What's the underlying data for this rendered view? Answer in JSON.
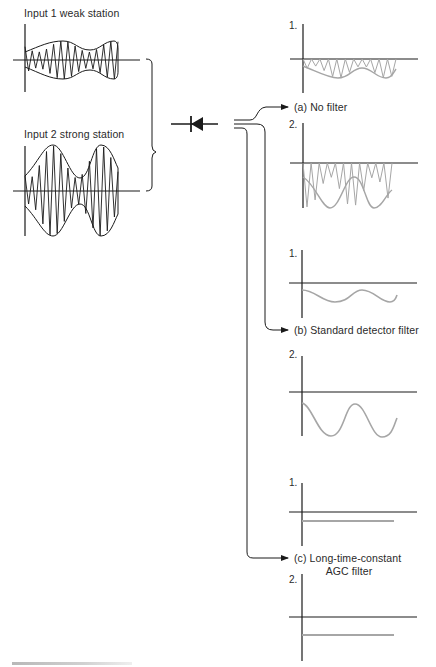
{
  "inputs": {
    "input1_label": "Input 1 weak station",
    "input2_label": "Input 2 strong station"
  },
  "outputs": {
    "a": {
      "label": "(a) No filter",
      "plot1_num": "1.",
      "plot2_num": "2."
    },
    "b": {
      "label": "(b) Standard detector filter",
      "plot1_num": "1.",
      "plot2_num": "2."
    },
    "c": {
      "label_line1": "(c) Long-time-constant",
      "label_line2": "AGC filter",
      "plot1_num": "1.",
      "plot2_num": "2."
    }
  },
  "components": {
    "detector": "diode"
  },
  "colors": {
    "ink": "#1a1a1a",
    "output_trace": "#a6a6a6"
  }
}
